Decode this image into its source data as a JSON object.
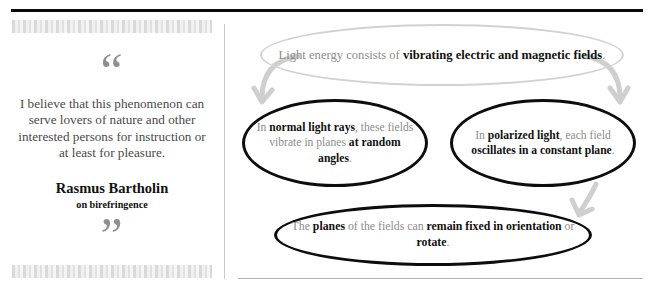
{
  "quote": {
    "open_mark": "“",
    "close_mark": "”",
    "text": "I believe that this phenomenon can serve lovers of nature and other interested persons for instruction or at least for pleasure.",
    "author": "Rasmus Bartholin",
    "subject": "on birefringence"
  },
  "diagram": {
    "type": "concept-map",
    "nodes": [
      {
        "id": "root",
        "style": "grey-ellipse",
        "border_color": "#d2d2d2",
        "html": "Light energy consists of <b>vibrating electric and magnetic fields</b>.",
        "plain": "Light energy consists of vibrating electric and magnetic fields."
      },
      {
        "id": "normal-light",
        "style": "black-ellipse",
        "border_color": "#0d0d0d",
        "html": "In <b>normal light rays</b>, these fields vibrate in planes <b>at random angles</b>.",
        "plain": "In normal light rays, these fields vibrate in planes at random angles."
      },
      {
        "id": "polarized-light",
        "style": "black-ellipse",
        "border_color": "#0d0d0d",
        "html": "In <b>polarized light</b>, each field <b>oscillates in a constant plane</b>.",
        "plain": "In polarized light, each field oscillates in a constant plane."
      },
      {
        "id": "planes",
        "style": "black-ellipse",
        "border_color": "#0d0d0d",
        "html": "The <b>planes</b> of the fields can <b>remain fixed in orientation</b> or <b>rotate</b>.",
        "plain": "The planes of the fields can remain fixed in orientation or rotate."
      }
    ],
    "edges": [
      {
        "from": "root",
        "to": "normal-light",
        "color": "#cfcfcf"
      },
      {
        "from": "root",
        "to": "polarized-light",
        "color": "#cfcfcf"
      },
      {
        "from": "polarized-light",
        "to": "planes",
        "color": "#cfcfcf"
      }
    ]
  },
  "rules": {
    "top_rule_color": "#0a0a0a",
    "divider_color": "#c9c9c9",
    "bottom_rule_color": "#b5b5b5"
  }
}
